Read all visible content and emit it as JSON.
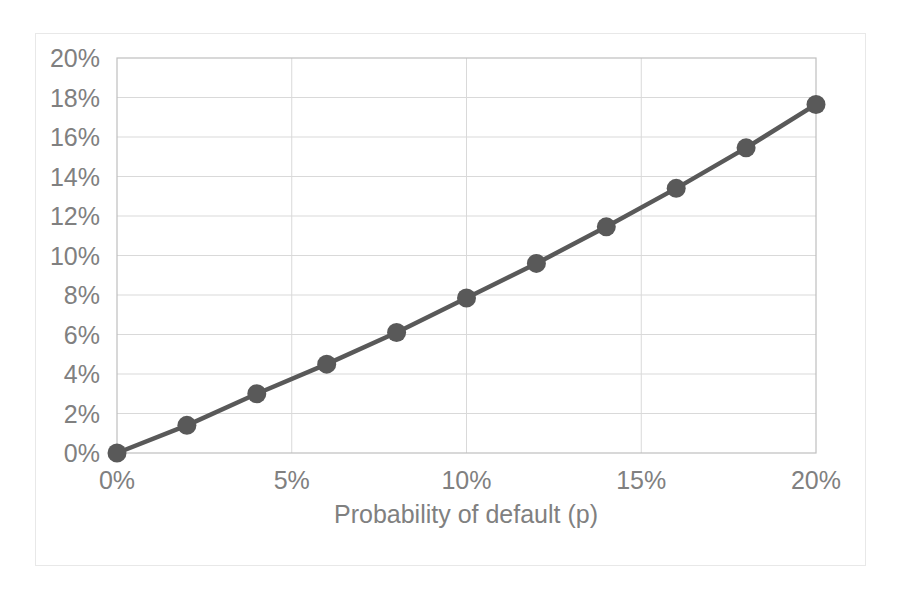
{
  "chart_data": {
    "type": "line",
    "title": "",
    "subtitle": "",
    "xlabel": "Probability of default (p)",
    "ylabel": "",
    "x": [
      0,
      2,
      4,
      6,
      8,
      10,
      12,
      14,
      16,
      18,
      20
    ],
    "values": [
      0,
      1.4,
      3.0,
      4.5,
      6.1,
      7.85,
      9.6,
      11.45,
      13.4,
      15.45,
      17.65
    ],
    "series": [
      {
        "name": "",
        "values": [
          0,
          1.4,
          3.0,
          4.5,
          6.1,
          7.85,
          9.6,
          11.45,
          13.4,
          15.45,
          17.65
        ]
      }
    ],
    "xlim": [
      0,
      20
    ],
    "ylim": [
      0,
      20
    ],
    "x_ticks": [
      0,
      5,
      10,
      15,
      20
    ],
    "x_tick_labels": [
      "0%",
      "5%",
      "10%",
      "15%",
      "20%"
    ],
    "y_ticks": [
      0,
      2,
      4,
      6,
      8,
      10,
      12,
      14,
      16,
      18,
      20
    ],
    "y_tick_labels": [
      "0%",
      "2%",
      "4%",
      "6%",
      "8%",
      "10%",
      "12%",
      "14%",
      "16%",
      "18%",
      "20%"
    ],
    "grid": true,
    "grid_axis": "both",
    "legend": false,
    "legend_position": "none",
    "marker": "circle",
    "series_color": "#595959",
    "grid_color": "#d9d9d9",
    "axis_color": "#bfbfbf",
    "tick_label_color": "#808080",
    "plot_background": "#ffffff",
    "frame_border_color": "#e8e8e8"
  }
}
